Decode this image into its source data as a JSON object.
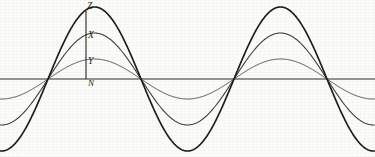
{
  "figure": {
    "background_color": "#fcfcfa",
    "ink_color": "#1e1c1a",
    "width": 375,
    "height": 157
  },
  "labels": {
    "peak_large": "Z",
    "peak_medium": "X",
    "peak_small": "Y",
    "origin": "N"
  },
  "chart_data": {
    "type": "line",
    "title": "",
    "subtitle": "",
    "xlabel": "",
    "ylabel": "",
    "grid": false,
    "legend": "none",
    "annotations": [
      {
        "text": "Z",
        "x": 86,
        "y": 7,
        "meaning": "crest of largest-amplitude curve on the ordinate"
      },
      {
        "text": "X",
        "x": 86,
        "y": 33,
        "meaning": "crest level of medium-amplitude curve"
      },
      {
        "text": "Y",
        "x": 86,
        "y": 59,
        "meaning": "crest level of smallest-amplitude curve"
      },
      {
        "text": "N",
        "x": 86,
        "y": 79,
        "meaning": "origin / zero level on the baseline axis"
      }
    ],
    "axis": {
      "baseline_y": 79,
      "ordinate_x": 86,
      "ordinate_from_y": 11,
      "ordinate_to_y": 79,
      "xlim": [
        0,
        375
      ],
      "ylim": [
        157,
        0
      ],
      "zero_crossings_px": [
        48,
        142,
        233,
        327
      ],
      "half_period_px": 93,
      "period_px": 186,
      "phase_offset_px": 48
    },
    "series": [
      {
        "name": "Y",
        "label": "smallest amplitude",
        "amplitude_px": 20,
        "stroke_width": 0.95,
        "color": "#4a4744",
        "peaks_px": [
          {
            "x": 95,
            "y": 59
          },
          {
            "x": 281,
            "y": 59
          }
        ],
        "troughs_px": [
          {
            "x": 188,
            "y": 99
          },
          {
            "x": 2,
            "y": 99
          }
        ]
      },
      {
        "name": "X",
        "label": "medium amplitude",
        "amplitude_px": 46,
        "stroke_width": 1.05,
        "color": "#3a3835",
        "peaks_px": [
          {
            "x": 95,
            "y": 33
          },
          {
            "x": 281,
            "y": 33
          }
        ],
        "troughs_px": [
          {
            "x": 188,
            "y": 125
          },
          {
            "x": 2,
            "y": 125
          }
        ]
      },
      {
        "name": "Z",
        "label": "largest amplitude",
        "amplitude_px": 72,
        "stroke_width": 1.65,
        "color": "#1e1c1a",
        "peaks_px": [
          {
            "x": 95,
            "y": 7
          },
          {
            "x": 281,
            "y": 7
          }
        ],
        "troughs_px": [
          {
            "x": 188,
            "y": 151
          },
          {
            "x": 2,
            "y": 151
          }
        ]
      }
    ]
  }
}
